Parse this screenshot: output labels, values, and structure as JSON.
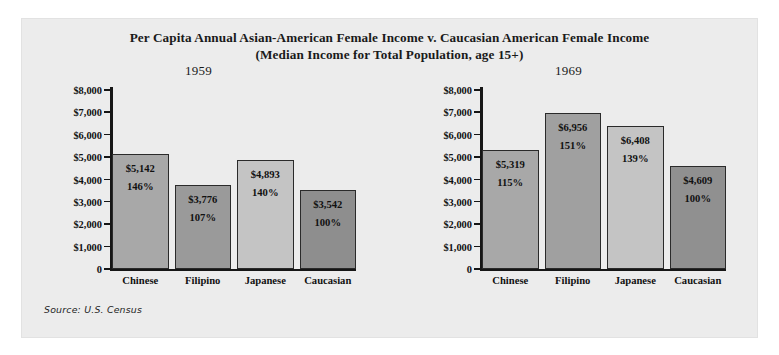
{
  "figure": {
    "title_line1": "Per Capita Annual Asian-American Female Income v. Caucasian American Female Income",
    "title_line2": "(Median Income for Total Population, age 15+)",
    "source": "Source: U.S. Census",
    "panel_color": "#ececec",
    "page_background": "#ffffff",
    "axis_color": "#161616"
  },
  "chart_data": [
    {
      "type": "bar",
      "title": "1959",
      "xlabel": "",
      "ylabel": "",
      "ylim": [
        0,
        8000
      ],
      "ytick_values": [
        8000,
        7000,
        6000,
        5000,
        4000,
        3000,
        2000,
        1000,
        0
      ],
      "ytick_labels": [
        "$8,000",
        "$7,000",
        "$6,000",
        "$5,000",
        "$4,000",
        "$3,000",
        "$2,000",
        "$1,000",
        "0"
      ],
      "grid": false,
      "legend": "none",
      "categories": [
        "Chinese",
        "Filipino",
        "Japanese",
        "Caucasian"
      ],
      "values": [
        5142,
        3776,
        4893,
        3542
      ],
      "value_labels": [
        "$5,142",
        "$3,776",
        "$4,893",
        "$3,542"
      ],
      "percent_labels": [
        "146%",
        "107%",
        "140%",
        "100%"
      ],
      "bar_colors": [
        "#a8a8a8",
        "#9a9a9a",
        "#c4c4c4",
        "#8e8e8e"
      ]
    },
    {
      "type": "bar",
      "title": "1969",
      "xlabel": "",
      "ylabel": "",
      "ylim": [
        0,
        8000
      ],
      "ytick_values": [
        8000,
        7000,
        6000,
        5000,
        4000,
        3000,
        2000,
        1000,
        0
      ],
      "ytick_labels": [
        "$8,000",
        "$7,000",
        "$6,000",
        "$5,000",
        "$4,000",
        "$3,000",
        "$2,000",
        "$1,000",
        "0"
      ],
      "grid": false,
      "legend": "none",
      "categories": [
        "Chinese",
        "Filipino",
        "Japanese",
        "Caucasian"
      ],
      "values": [
        5319,
        6956,
        6408,
        4609
      ],
      "value_labels": [
        "$5,319",
        "$6,956",
        "$6,408",
        "$4,609"
      ],
      "percent_labels": [
        "115%",
        "151%",
        "139%",
        "100%"
      ],
      "bar_colors": [
        "#a8a8a8",
        "#a0a0a0",
        "#c4c4c4",
        "#909090"
      ]
    }
  ]
}
